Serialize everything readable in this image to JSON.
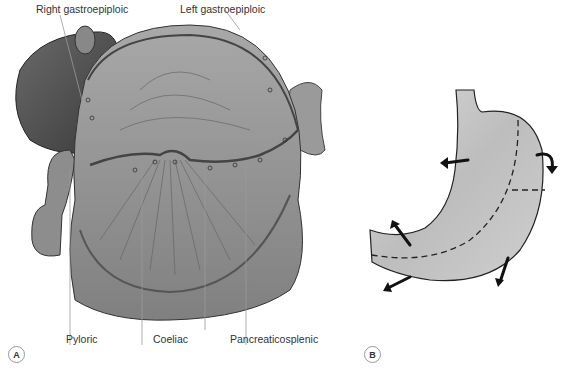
{
  "figure": {
    "panel_a": {
      "badge": "A",
      "labels": {
        "right_gastroepiploic": "Right gastroepiploic",
        "left_gastroepiploic": "Left gastroepiploic",
        "pyloric": "Pyloric",
        "coeliac": "Coeliac",
        "pancreaticosplenic": "Pancreaticosplenic"
      }
    },
    "panel_b": {
      "badge": "B"
    }
  }
}
